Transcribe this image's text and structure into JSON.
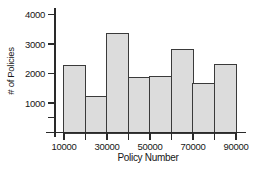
{
  "figure": {
    "background": "#ffffff"
  },
  "chart_data": {
    "type": "bar",
    "chart_kind": "histogram",
    "title": "",
    "xlabel": "Policy Number",
    "ylabel": "# of Policies",
    "bin_edges": [
      10000,
      20000,
      30000,
      40000,
      50000,
      60000,
      70000,
      80000,
      90000
    ],
    "values": [
      2250,
      1200,
      3350,
      1850,
      1900,
      2800,
      1650,
      2300
    ],
    "xlim": [
      10000,
      90000
    ],
    "ylim": [
      0,
      4000
    ],
    "x_ticks": [
      {
        "value": 10000,
        "label": "10000"
      },
      {
        "value": 20000,
        "label": ""
      },
      {
        "value": 30000,
        "label": "30000"
      },
      {
        "value": 40000,
        "label": ""
      },
      {
        "value": 50000,
        "label": "50000"
      },
      {
        "value": 60000,
        "label": ""
      },
      {
        "value": 70000,
        "label": "70000"
      },
      {
        "value": 80000,
        "label": ""
      },
      {
        "value": 90000,
        "label": "90000"
      }
    ],
    "y_ticks": [
      {
        "value": 500,
        "label": ""
      },
      {
        "value": 1000,
        "label": "1000"
      },
      {
        "value": 2000,
        "label": "2000"
      },
      {
        "value": 3000,
        "label": "3000"
      },
      {
        "value": 4000,
        "label": "4000"
      }
    ],
    "grid": false,
    "legend": null,
    "colors": {
      "bar_fill": "#dcdcdc",
      "bar_border": "#3a3a3a",
      "axis_color": "#2a2a2a",
      "text_color": "#161616",
      "background": "#ffffff"
    }
  }
}
